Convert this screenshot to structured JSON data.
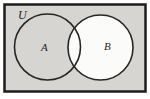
{
  "diagram": {
    "type": "venn",
    "universal_set": {
      "label": "U",
      "fill": "#d6d5d2",
      "border_color": "#1c1c1c"
    },
    "set_a": {
      "label": "A",
      "fill": "none",
      "note": "interior shaded same gray as universal set background"
    },
    "set_b": {
      "label": "B",
      "fill": "#fbfbfa",
      "note": "entire circle including intersection with A is unshaded white"
    },
    "circle_stroke_color": "#262626",
    "outside_margin_color": "#ffffff"
  }
}
